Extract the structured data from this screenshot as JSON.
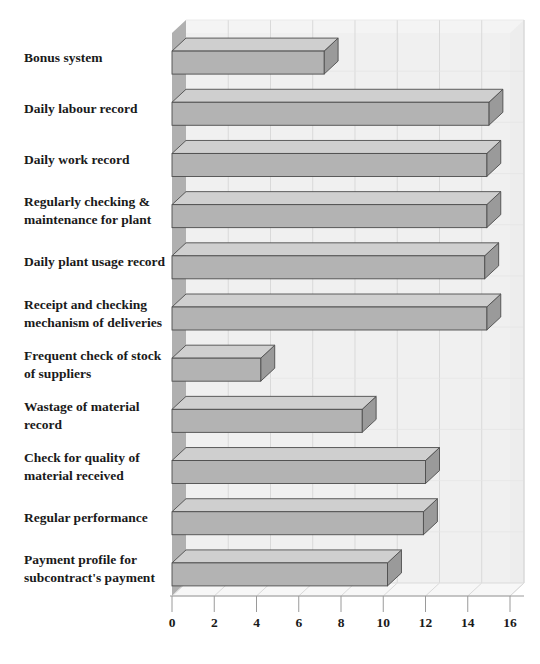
{
  "chart_data": {
    "type": "bar",
    "orientation": "horizontal",
    "style": "3d-perspective",
    "title": "",
    "subtitle": "",
    "xlabel": "",
    "ylabel": "",
    "xlim": [
      0,
      16
    ],
    "xticks": [
      0,
      2,
      4,
      6,
      8,
      10,
      12,
      14,
      16
    ],
    "xtick_labels": [
      "0",
      "2",
      "4",
      "6",
      "8",
      "10",
      "12",
      "14",
      "16"
    ],
    "grid": true,
    "legend": false,
    "categories": [
      "Bonus system",
      "Daily labour record",
      "Daily work record",
      "Regularly checking & maintenance for plant",
      "Daily plant usage record",
      "Receipt and checking mechanism of deliveries",
      "Frequent check of stock of  suppliers",
      "Wastage of material record",
      "Check for quality of material received",
      "Regular performance",
      "Payment profile for subcontract's payment"
    ],
    "category_lines": [
      [
        "Bonus system"
      ],
      [
        "Daily labour record"
      ],
      [
        "Daily work record"
      ],
      [
        "Regularly checking &",
        "maintenance for plant"
      ],
      [
        "Daily plant usage record"
      ],
      [
        "Receipt and checking",
        "mechanism of deliveries"
      ],
      [
        "Frequent check of stock",
        "of  suppliers"
      ],
      [
        "Wastage of material",
        "record"
      ],
      [
        "Check for quality of",
        "material received"
      ],
      [
        "Regular performance"
      ],
      [
        "Payment profile for",
        "subcontract's payment"
      ]
    ],
    "values": [
      7.2,
      15.0,
      14.9,
      14.9,
      14.8,
      14.9,
      4.2,
      9.0,
      12.0,
      11.9,
      10.2
    ]
  },
  "colors": {
    "bar_front": "#b3b3b3",
    "bar_top": "#cfcfcf",
    "bar_side": "#9a9a9a",
    "bar_outline": "#4d4d4d",
    "plot_background": "#f2f2f2",
    "floor": "#f7f7f7",
    "back_wall": "#ededed",
    "left_wall": "#b0b0b0",
    "gridline": "#d9d9d9",
    "axis_line": "#9a9a9a",
    "text": "#1a1a1a",
    "page_background": "#ffffff"
  }
}
